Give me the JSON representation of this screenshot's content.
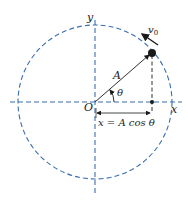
{
  "diagram": {
    "labels": {
      "y_axis": "y",
      "x_axis": "x",
      "origin": "O",
      "radius": "A",
      "angle": "θ",
      "velocity": "v",
      "velocity_sub": "0",
      "projection": "x = A cos θ"
    },
    "colors": {
      "dashed_lines": "#3a6fb0",
      "ink": "#1a1a1a",
      "background": "#ffffff"
    }
  }
}
